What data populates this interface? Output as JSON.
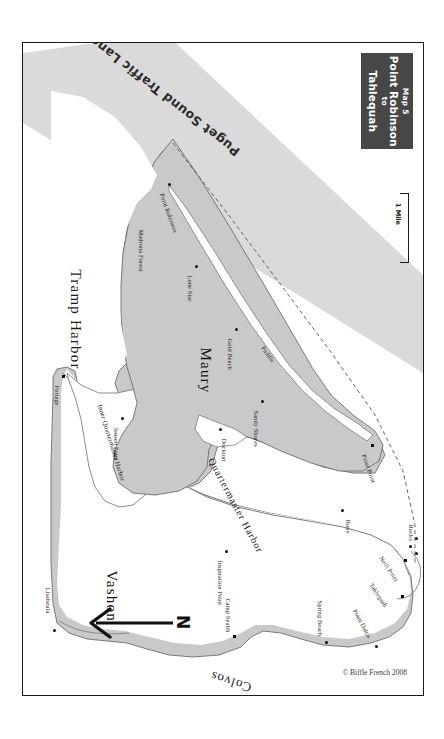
{
  "title_block": {
    "map_number": "Map 5",
    "from": "Point Robinson",
    "connector": "to",
    "to": "Tahlequah"
  },
  "scale": {
    "label": "1 Mile"
  },
  "north_arrow": {
    "letter": "N"
  },
  "credit": "© Biffle French 2008",
  "regions": [
    {
      "name": "Tramp Harbor",
      "type": "water",
      "x": 52,
      "y": 218,
      "rotate": 90
    },
    {
      "name": "Maury",
      "type": "land",
      "x": 182,
      "y": 296,
      "rotate": 90
    },
    {
      "name": "Vashon",
      "type": "land",
      "x": 88,
      "y": 519,
      "rotate": 90
    },
    {
      "name": "Quartermaster Harbor",
      "type": "water",
      "x": 188,
      "y": 410,
      "rotate": 62
    },
    {
      "name": "Inner Quartermaster Harbor",
      "type": "water",
      "x": 77,
      "y": 358,
      "rotate": 73
    },
    {
      "name": "Colvos",
      "type": "water",
      "x": 228,
      "y": 637,
      "rotate": 198
    },
    {
      "name": "Puget Sound Traffic Lane",
      "type": "lane",
      "x": 215,
      "y": 103,
      "rotate": 218
    }
  ],
  "places": [
    {
      "name": "Point Robinson",
      "marker": "dot",
      "mx": 145,
      "my": 140,
      "lx": 139,
      "ly": 147,
      "rotate": 70
    },
    {
      "name": "Madrona Forest",
      "marker": "none",
      "mx": 0,
      "my": 0,
      "lx": 118,
      "ly": 183,
      "rotate": 90
    },
    {
      "name": "Lone Star",
      "marker": "dot",
      "mx": 172,
      "my": 222,
      "lx": 167,
      "ly": 229,
      "rotate": 90
    },
    {
      "name": "Gold Beach",
      "marker": "dot",
      "mx": 212,
      "my": 285,
      "lx": 207,
      "ly": 292,
      "rotate": 90
    },
    {
      "name": "Puddle",
      "marker": "none",
      "mx": 0,
      "my": 0,
      "lx": 240,
      "ly": 300,
      "rotate": 55
    },
    {
      "name": "Sandy Shores",
      "marker": "dot",
      "mx": 238,
      "my": 357,
      "lx": 233,
      "ly": 364,
      "rotate": 90
    },
    {
      "name": "Dockton",
      "marker": "dot",
      "mx": 196,
      "my": 385,
      "lx": 201,
      "ly": 392,
      "rotate": 90
    },
    {
      "name": "Jensen Point",
      "marker": "dot",
      "mx": 98,
      "my": 374,
      "lx": 93,
      "ly": 381,
      "rotate": 90
    },
    {
      "name": "Portage",
      "marker": "dot",
      "mx": 39,
      "my": 332,
      "lx": 34,
      "ly": 339,
      "rotate": 90
    },
    {
      "name": "Piner Point",
      "marker": "sq",
      "mx": 348,
      "my": 401,
      "lx": 341,
      "ly": 408,
      "rotate": 70
    },
    {
      "name": "Buoy",
      "marker": "dot",
      "mx": 318,
      "my": 466,
      "lx": 325,
      "ly": 473,
      "rotate": 90
    },
    {
      "name": "Rocks",
      "marker": "dot",
      "mx": 403,
      "my": 498,
      "lx": 398,
      "ly": 503,
      "rotate": 90
    },
    {
      "name": "Neill Point",
      "marker": "sq",
      "mx": 389,
      "my": 516,
      "lx": 373,
      "ly": 524,
      "rotate": 56
    },
    {
      "name": "Tahlequah",
      "marker": "sq",
      "mx": 389,
      "my": 551,
      "lx": 365,
      "ly": 552,
      "rotate": 56
    },
    {
      "name": "Point Dalco",
      "marker": "dot",
      "mx": 372,
      "my": 594,
      "lx": 354,
      "ly": 580,
      "rotate": 62
    },
    {
      "name": "Spring Beach",
      "marker": "dot",
      "mx": 317,
      "my": 588,
      "lx": 322,
      "ly": 577,
      "rotate": 90
    },
    {
      "name": "Camp Sealth",
      "marker": "sq",
      "mx": 226,
      "my": 592,
      "lx": 221,
      "ly": 565,
      "rotate": 90
    },
    {
      "name": "Inspiration Point",
      "marker": "dot",
      "mx": 202,
      "my": 507,
      "lx": 197,
      "ly": 514,
      "rotate": 90
    },
    {
      "name": "Lisabeula",
      "marker": "dot",
      "mx": 38,
      "my": 586,
      "lx": 33,
      "ly": 563,
      "rotate": 90
    }
  ],
  "colors": {
    "land": "#c9c9c9",
    "land_stroke": "#6e6e6e",
    "water": "#ffffff",
    "lane_fill": "#d4d4d4",
    "title_block_bg": "#474747",
    "title_block_fg": "#ffffff",
    "frame": "#1a1a1a",
    "text": "#141414"
  }
}
